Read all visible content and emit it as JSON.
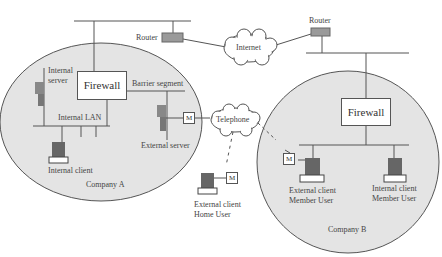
{
  "diagram": {
    "type": "network-topology",
    "nodes": {
      "router_a": "Router",
      "router_b": "Router",
      "internet": "Internet",
      "telephone": "Telephone",
      "firewall_a": "Firewall",
      "firewall_b": "Firewall",
      "internal_server_1": "Internal",
      "internal_server_2": "server",
      "barrier_segment": "Barrier segment",
      "internal_lan": "Internal LAN",
      "external_server": "External server",
      "internal_client": "Internal client",
      "company_a": "Company A",
      "home_user_1": "External client",
      "home_user_2": "Home User",
      "ext_member_1": "External client",
      "ext_member_2": "Member User",
      "int_member_1": "Internal client",
      "int_member_2": "Member User",
      "company_b": "Company B",
      "modem": "M"
    },
    "colors": {
      "zone_fill": "#e4e4e4",
      "line": "#555555",
      "device": "#6a6a6a"
    }
  }
}
